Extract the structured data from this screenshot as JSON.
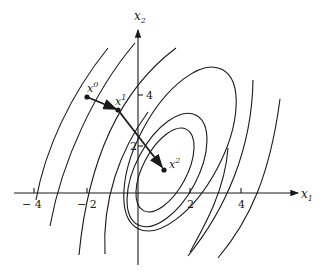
{
  "figure": {
    "axes": {
      "x_label": "x",
      "x_label_sub": "1",
      "y_label": "x",
      "y_label_sub": "2",
      "x_ticks": [
        {
          "value": -4,
          "label": "− 4"
        },
        {
          "value": -2,
          "label": "− 2"
        },
        {
          "value": 2,
          "label": "2"
        },
        {
          "value": 4,
          "label": "4"
        }
      ],
      "y_ticks": [
        {
          "value": 2,
          "label": "2"
        },
        {
          "value": 4,
          "label": "4"
        }
      ]
    },
    "iterates": [
      {
        "name": "x",
        "sup": "0",
        "x": -2.0,
        "y": 3.8
      },
      {
        "name": "x",
        "sup": "1",
        "x": -0.8,
        "y": 3.3
      },
      {
        "name": "x",
        "sup": "2",
        "x": 1.0,
        "y": 0.9
      }
    ],
    "contours": {
      "closed_ellipses": 3,
      "open_arcs_left": 4,
      "open_arcs_right": 3,
      "center": {
        "x": 1.0,
        "y": 1.0
      }
    },
    "colors": {
      "ink": "#1a1a1a",
      "background": "#ffffff"
    }
  }
}
